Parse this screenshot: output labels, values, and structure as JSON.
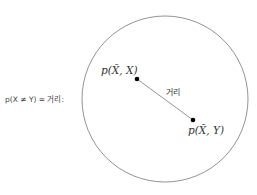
{
  "left_label": "p(X ≠ Y) = 거리:",
  "point_a": {
    "label": "p(X̃, X)",
    "x": 137,
    "y": 79
  },
  "point_b": {
    "label": "p(X̃, Y)",
    "x": 193,
    "y": 120
  },
  "edge_label": "거리",
  "circle": {
    "cx": 165,
    "cy": 99,
    "r": 83,
    "stroke": "#777777"
  },
  "colors": {
    "line": "#888888",
    "point": "#000000",
    "text": "#333333"
  }
}
